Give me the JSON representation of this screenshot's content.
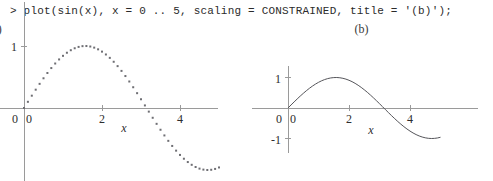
{
  "command": {
    "prompt": ">",
    "text": "> plot(sin(x), x = 0 .. 5, scaling = CONSTRAINED, title = '(b)');"
  },
  "plots": [
    {
      "id": "a",
      "title": "(a)",
      "style": "dotted",
      "scaling": "default",
      "x_ticks": [
        "2",
        "4"
      ],
      "y_ticks": [
        "1"
      ],
      "origin_x_label": "0",
      "origin_y_label": "0",
      "xlabel": "x"
    },
    {
      "id": "b",
      "title": "(b)",
      "style": "solid",
      "scaling": "CONSTRAINED",
      "x_ticks": [
        "2",
        "4"
      ],
      "y_ticks": [
        "1",
        "-1"
      ],
      "origin_x_label": "0",
      "origin_y_label": "0",
      "xlabel": "x"
    }
  ],
  "colors": {
    "axis": "#9a9a9a",
    "curve": "#55555a",
    "text": "#2d2d2d",
    "command_text": "#2b2b2b",
    "background": "#ffffff"
  },
  "chart_data": [
    {
      "type": "line",
      "title": "(a)",
      "function": "sin(x)",
      "marker": "dotted",
      "xlabel": "x",
      "ylabel": "",
      "xlim": [
        0,
        5
      ],
      "ylim": [
        -1,
        1
      ],
      "grid": false,
      "legend": "none",
      "xticks": [
        0,
        2,
        4
      ],
      "yticks": [
        0,
        1
      ],
      "note": "Unconstrained scaling: vertical axis stretched, curve runs off bottom of viewport",
      "x": [
        0,
        0.1,
        0.2,
        0.3,
        0.4,
        0.5,
        0.6,
        0.7,
        0.8,
        0.9,
        1.0,
        1.1,
        1.2,
        1.3,
        1.4,
        1.5,
        1.6,
        1.7,
        1.8,
        1.9,
        2.0,
        2.1,
        2.2,
        2.3,
        2.4,
        2.5,
        2.6,
        2.7,
        2.8,
        2.9,
        3.0,
        3.1,
        3.2,
        3.3,
        3.4,
        3.5,
        3.6,
        3.7,
        3.8,
        3.9,
        4.0,
        4.1,
        4.2,
        4.3,
        4.4,
        4.5,
        4.6,
        4.7,
        4.8,
        4.9,
        5.0
      ],
      "y": [
        0,
        0.0998,
        0.1987,
        0.2955,
        0.3894,
        0.4794,
        0.5646,
        0.6442,
        0.7174,
        0.7833,
        0.8415,
        0.8912,
        0.932,
        0.9636,
        0.9854,
        0.9975,
        0.9996,
        0.9917,
        0.9738,
        0.9463,
        0.9093,
        0.8632,
        0.8085,
        0.7457,
        0.6755,
        0.5985,
        0.5155,
        0.4274,
        0.335,
        0.2392,
        0.1411,
        0.0416,
        -0.0584,
        -0.1577,
        -0.2555,
        -0.3508,
        -0.4425,
        -0.5298,
        -0.6119,
        -0.6878,
        -0.7568,
        -0.8183,
        -0.8716,
        -0.9162,
        -0.9516,
        -0.9775,
        -0.9937,
        -0.9999,
        -0.9962,
        -0.9825,
        -0.9589
      ]
    },
    {
      "type": "line",
      "title": "(b)",
      "function": "sin(x)",
      "marker": "solid",
      "xlabel": "x",
      "ylabel": "",
      "xlim": [
        0,
        5
      ],
      "ylim": [
        -1,
        1
      ],
      "grid": false,
      "legend": "none",
      "xticks": [
        0,
        2,
        4
      ],
      "yticks": [
        -1,
        0,
        1
      ],
      "note": "CONSTRAINED scaling: equal unit lengths on both axes, full curve visible",
      "x": [
        0,
        0.1,
        0.2,
        0.3,
        0.4,
        0.5,
        0.6,
        0.7,
        0.8,
        0.9,
        1.0,
        1.1,
        1.2,
        1.3,
        1.4,
        1.5,
        1.6,
        1.7,
        1.8,
        1.9,
        2.0,
        2.1,
        2.2,
        2.3,
        2.4,
        2.5,
        2.6,
        2.7,
        2.8,
        2.9,
        3.0,
        3.1,
        3.2,
        3.3,
        3.4,
        3.5,
        3.6,
        3.7,
        3.8,
        3.9,
        4.0,
        4.1,
        4.2,
        4.3,
        4.4,
        4.5,
        4.6,
        4.7,
        4.8,
        4.9,
        5.0
      ],
      "y": [
        0,
        0.0998,
        0.1987,
        0.2955,
        0.3894,
        0.4794,
        0.5646,
        0.6442,
        0.7174,
        0.7833,
        0.8415,
        0.8912,
        0.932,
        0.9636,
        0.9854,
        0.9975,
        0.9996,
        0.9917,
        0.9738,
        0.9463,
        0.9093,
        0.8632,
        0.8085,
        0.7457,
        0.6755,
        0.5985,
        0.5155,
        0.4274,
        0.335,
        0.2392,
        0.1411,
        0.0416,
        -0.0584,
        -0.1577,
        -0.2555,
        -0.3508,
        -0.4425,
        -0.5298,
        -0.6119,
        -0.6878,
        -0.7568,
        -0.8183,
        -0.8716,
        -0.9162,
        -0.9516,
        -0.9775,
        -0.9937,
        -0.9999,
        -0.9962,
        -0.9825,
        -0.9589
      ]
    }
  ]
}
